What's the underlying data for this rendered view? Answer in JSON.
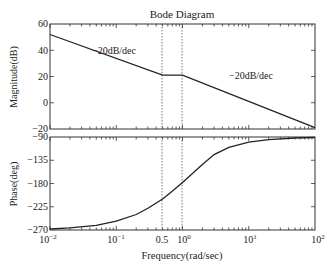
{
  "title": "Bode Diagram",
  "chart_data": [
    {
      "type": "line",
      "panel": "magnitude",
      "title": "Bode Diagram",
      "xlabel": "Frequency(rad/sec)",
      "ylabel": "Magnitude(dB)",
      "xscale": "log",
      "xlim": [
        0.01,
        100
      ],
      "ylim": [
        -20,
        60
      ],
      "yticks": [
        60,
        40,
        20,
        0,
        -20
      ],
      "series": [
        {
          "name": "Magnitude asymptote",
          "x": [
            0.01,
            0.5,
            1,
            100
          ],
          "y": [
            52,
            21,
            21,
            -19
          ]
        }
      ],
      "annotations": [
        {
          "text": "−20dB/dec",
          "x": 0.05,
          "y": 45
        },
        {
          "text": "−20dB/dec",
          "x": 5,
          "y": 21
        }
      ],
      "vlines": [
        0.5,
        1
      ]
    },
    {
      "type": "line",
      "panel": "phase",
      "xlabel": "Frequency(rad/sec)",
      "ylabel": "Phase(deg)",
      "xscale": "log",
      "xlim": [
        0.01,
        100
      ],
      "ylim": [
        -270,
        -90
      ],
      "yticks": [
        -90,
        -135,
        -180,
        -225,
        -270
      ],
      "xticks": [
        "10⁻²",
        "10⁻¹",
        "0.5",
        "10⁰",
        "10¹",
        "10²"
      ],
      "series": [
        {
          "name": "Phase",
          "x": [
            0.01,
            0.02,
            0.05,
            0.1,
            0.2,
            0.3,
            0.5,
            0.7,
            1,
            2,
            3,
            5,
            10,
            20,
            50,
            100
          ],
          "y": [
            -268,
            -266,
            -261,
            -253,
            -240,
            -228,
            -210,
            -195,
            -178,
            -143,
            -124,
            -110,
            -100,
            -95,
            -92,
            -91
          ]
        }
      ],
      "vlines": [
        0.5,
        1
      ]
    }
  ],
  "labels": {
    "mag_ylabel": "Magnitude(dB)",
    "phase_ylabel": "Phase(deg)",
    "xlabel": "Frequency(rad/sec)",
    "slope1": "−20dB/dec",
    "slope2": "−20dB/dec",
    "mag_ticks": [
      "60",
      "40",
      "20",
      "0",
      "−20"
    ],
    "phase_ticks": [
      "−90",
      "−135",
      "−180",
      "−225",
      "−270"
    ],
    "x_ticks": [
      "10",
      "10",
      "0.5",
      "10",
      "10",
      "10"
    ],
    "x_exps": [
      "−2",
      "−1",
      "",
      "0",
      "1",
      "2"
    ]
  }
}
